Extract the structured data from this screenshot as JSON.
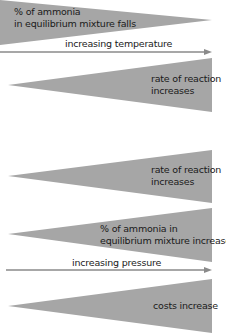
{
  "colors": {
    "wedge": "#a6a6a6",
    "arrow": "#8a8a8a",
    "text": "#1a1a1a",
    "background": "#ffffff"
  },
  "temperature_section": {
    "arrow_label": "increasing temperature",
    "wedges": [
      {
        "direction": "decreasing",
        "line1": "% of ammonia",
        "line2": "in equilibrium mixture falls"
      },
      {
        "direction": "increasing",
        "line1": "rate of reaction",
        "line2": "increases"
      }
    ]
  },
  "pressure_section": {
    "arrow_label": "increasing pressure",
    "wedges": [
      {
        "direction": "increasing",
        "line1": "rate of reaction",
        "line2": "increases"
      },
      {
        "direction": "increasing",
        "line1": "% of ammonia in",
        "line2": "equilibrium mixture increases"
      },
      {
        "direction": "increasing",
        "line1": "costs increase",
        "line2": ""
      }
    ]
  }
}
